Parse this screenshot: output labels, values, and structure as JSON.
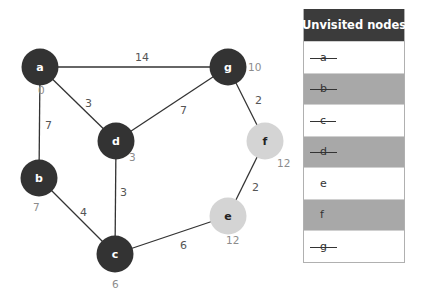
{
  "graph": {
    "nodes": [
      {
        "id": "a",
        "label": "a",
        "x": 40,
        "y": 67,
        "distance": "0",
        "visited": true,
        "fill": "#333333"
      },
      {
        "id": "b",
        "label": "b",
        "x": 39,
        "y": 178,
        "distance": "7",
        "visited": true,
        "fill": "#333333"
      },
      {
        "id": "c",
        "label": "c",
        "x": 115,
        "y": 254,
        "distance": "6",
        "visited": true,
        "fill": "#333333"
      },
      {
        "id": "d",
        "label": "d",
        "x": 116,
        "y": 141,
        "distance": "3",
        "visited": true,
        "fill": "#333333"
      },
      {
        "id": "e",
        "label": "e",
        "x": 228,
        "y": 216,
        "distance": "12",
        "visited": false,
        "fill": "#d4d4d4"
      },
      {
        "id": "f",
        "label": "f",
        "x": 265,
        "y": 141,
        "distance": "12",
        "visited": false,
        "fill": "#d4d4d4"
      },
      {
        "id": "g",
        "label": "g",
        "x": 228,
        "y": 67,
        "distance": "10",
        "visited": true,
        "fill": "#333333"
      }
    ],
    "edges": [
      {
        "from": "a",
        "to": "g",
        "weight": "14",
        "lx": 135,
        "ly": 61
      },
      {
        "from": "a",
        "to": "d",
        "weight": "3",
        "lx": 85,
        "ly": 107
      },
      {
        "from": "a",
        "to": "b",
        "weight": "7",
        "lx": 45,
        "ly": 129
      },
      {
        "from": "g",
        "to": "d",
        "weight": "7",
        "lx": 180,
        "ly": 114
      },
      {
        "from": "g",
        "to": "f",
        "weight": "2",
        "lx": 255,
        "ly": 104
      },
      {
        "from": "d",
        "to": "c",
        "weight": "3",
        "lx": 120,
        "ly": 196
      },
      {
        "from": "b",
        "to": "c",
        "weight": "4",
        "lx": 80,
        "ly": 216
      },
      {
        "from": "f",
        "to": "e",
        "weight": "2",
        "lx": 252,
        "ly": 191
      },
      {
        "from": "c",
        "to": "e",
        "weight": "6",
        "lx": 180,
        "ly": 249
      }
    ]
  },
  "table": {
    "header": "Unvisited nodes",
    "rows": [
      {
        "label": "a",
        "visited": true,
        "shaded": false
      },
      {
        "label": "b",
        "visited": true,
        "shaded": true
      },
      {
        "label": "c",
        "visited": true,
        "shaded": false
      },
      {
        "label": "d",
        "visited": true,
        "shaded": true
      },
      {
        "label": "e",
        "visited": false,
        "shaded": false
      },
      {
        "label": "f",
        "visited": false,
        "shaded": true
      },
      {
        "label": "g",
        "visited": true,
        "shaded": false
      }
    ]
  }
}
